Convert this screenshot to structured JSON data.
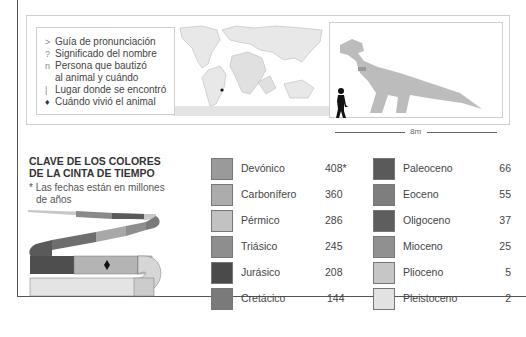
{
  "legend": {
    "items": [
      {
        "symbol": ">",
        "text": "Guía de pronunciación"
      },
      {
        "symbol": "?",
        "text": "Significado del nombre"
      },
      {
        "symbol": "n",
        "text": "Persona que bautizó"
      },
      {
        "symbol": "",
        "text": "al animal y cuándo"
      },
      {
        "symbol": "|",
        "text": "Lugar donde se encontró"
      },
      {
        "symbol": "♦",
        "text": "Cuándo vivió el animal"
      }
    ]
  },
  "scale": {
    "label": "8m"
  },
  "key": {
    "title_line1": "CLAVE DE LOS COLORES",
    "title_line2": "DE LA CINTA DE TIEMPO",
    "note_line1": "* Las fechas están en millones",
    "note_line2": "de años"
  },
  "periods_left": [
    {
      "name": "Devónico",
      "value": "408*",
      "color": "#9a9a9a"
    },
    {
      "name": "Carbonífero",
      "value": "360",
      "color": "#acacac"
    },
    {
      "name": "Pérmico",
      "value": "286",
      "color": "#c2c2c2"
    },
    {
      "name": "Triásico",
      "value": "245",
      "color": "#8e8e8e"
    },
    {
      "name": "Jurásico",
      "value": "208",
      "color": "#4a4a4a"
    },
    {
      "name": "Cretácico",
      "value": "144",
      "color": "#7a7a7a"
    }
  ],
  "periods_right": [
    {
      "name": "Paleoceno",
      "value": "66",
      "color": "#5a5a5a"
    },
    {
      "name": "Eoceno",
      "value": "55",
      "color": "#7e7e7e"
    },
    {
      "name": "Oligoceno",
      "value": "37",
      "color": "#5e5e5e"
    },
    {
      "name": "Mioceno",
      "value": "25",
      "color": "#909090"
    },
    {
      "name": "Plioceno",
      "value": "5",
      "color": "#c6c6c6"
    },
    {
      "name": "Pleistoceno",
      "value": "2",
      "color": "#e2e2e2"
    }
  ]
}
